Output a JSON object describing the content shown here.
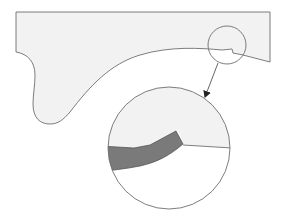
{
  "diagram": {
    "colors": {
      "background": "#ffffff",
      "part_fill": "#f2f2f2",
      "outline": "#6e6e6e",
      "detail_band": "#7a7a7a",
      "arrow": "#333333"
    },
    "callout_small_circle": {
      "cx": 227,
      "cy": 45,
      "r": 19
    },
    "callout_large_circle": {
      "cx": 169,
      "cy": 148,
      "r": 61
    },
    "arrow": {
      "x1": 218,
      "y1": 63,
      "x2": 205,
      "y2": 97
    }
  }
}
